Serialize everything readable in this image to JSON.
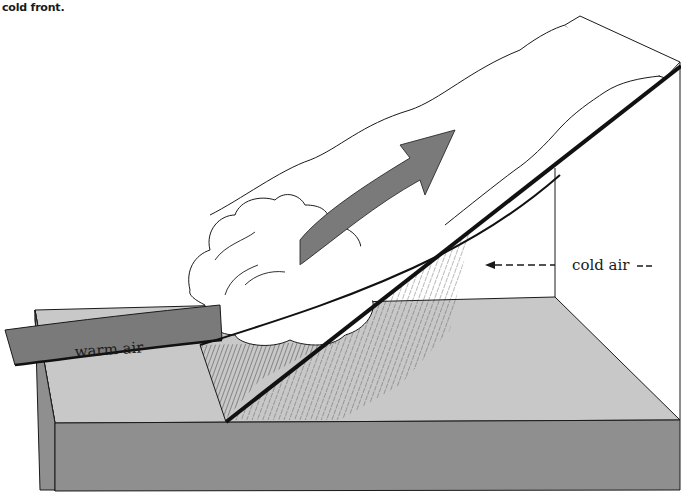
{
  "caption": "cold front.",
  "labels": {
    "warm_air": "warm air",
    "cold_air": "cold air"
  },
  "colors": {
    "ground_top": "#c8c8c8",
    "ground_side": "#8f8f8f",
    "warm_air_arrow": "#7a7a7a",
    "cloud_fill": "#ffffff",
    "outline": "#1a1a1a",
    "front_line": "#111111"
  }
}
